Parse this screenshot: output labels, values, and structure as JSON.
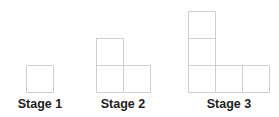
{
  "figure": {
    "title": "",
    "stages": [
      {
        "label": "Stage 1",
        "squares": 1,
        "label_x": 40
      },
      {
        "label": "Stage 2",
        "squares": 3,
        "label_x": 123
      },
      {
        "label": "Stage 3",
        "squares": 5,
        "label_x": 229
      }
    ],
    "colors": {
      "square_border": "#cfcfcf",
      "label_text": "#222222",
      "background": "#ffffff"
    }
  }
}
